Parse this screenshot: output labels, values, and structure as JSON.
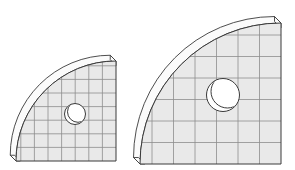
{
  "scene": {
    "title": "Two quarter-disc plates with central bore",
    "background_color": "#ffffff",
    "width": 295,
    "height": 170,
    "projection": "oblique-3d",
    "face_fill": "#e9e9e9",
    "edge_fill": "#fbfbfb",
    "outline_color": "#3a3a3a",
    "grid_color": "#8d8d8d",
    "hole_fill": "#ffffff"
  },
  "objects": [
    {
      "id": "plate-small",
      "label": "Small quarter-disc plate",
      "bounds": {
        "x": 13,
        "y": 49,
        "width": 105,
        "height": 114
      },
      "corner": {
        "x": 116,
        "y": 161
      },
      "radius": 100,
      "thickness": 8,
      "grid_spacing": 13.6,
      "grid_columns": 7,
      "grid_rows": 8,
      "hole": {
        "cx": 75,
        "cy": 114,
        "r": 10.5,
        "bore_offset_x": 3.0,
        "bore_offset_y": -2.2
      }
    },
    {
      "id": "plate-large",
      "label": "Large quarter-disc plate",
      "bounds": {
        "x": 136,
        "y": 11,
        "width": 147,
        "height": 154
      },
      "corner": {
        "x": 281,
        "y": 164
      },
      "radius": 141,
      "thickness": 9,
      "grid_spacing": 21.5,
      "grid_columns": 7,
      "grid_rows": 7,
      "hole": {
        "cx": 223,
        "cy": 95,
        "r": 16.5,
        "bore_offset_x": 4.5,
        "bore_offset_y": -3.5
      }
    }
  ]
}
